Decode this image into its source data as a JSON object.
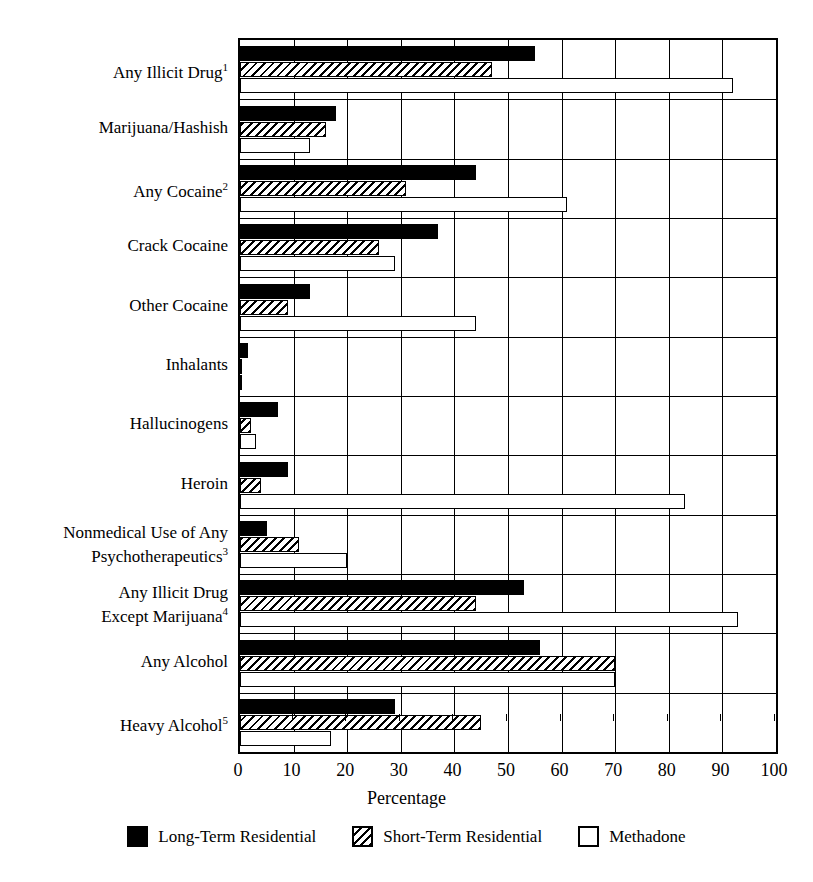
{
  "chart_data": {
    "type": "bar",
    "orientation": "horizontal",
    "title": "",
    "xlabel": "Percentage",
    "ylabel": "",
    "xlim": [
      0,
      100
    ],
    "xticks": [
      "0",
      "10",
      "20",
      "30",
      "40",
      "50",
      "60",
      "70",
      "80",
      "90",
      "100"
    ],
    "grid": true,
    "legend_position": "bottom",
    "categories": [
      "Any Illicit Drug¹",
      "Marijuana/Hashish",
      "Any Cocaine²",
      "Crack Cocaine",
      "Other Cocaine",
      "Inhalants",
      "Hallucinogens",
      "Heroin",
      "Nonmedical Use of Any\nPsychotherapeutics³",
      "Any Illicit Drug\nExcept Marijuana⁴",
      "Any Alcohol",
      "Heavy Alcohol⁵"
    ],
    "series": [
      {
        "name": "Long-Term Residential",
        "fill": "solid-black",
        "color": "#000000",
        "values": [
          55,
          18,
          44,
          37,
          13,
          1.5,
          7,
          9,
          5,
          53,
          56,
          29
        ]
      },
      {
        "name": "Short-Term Residential",
        "fill": "hatched",
        "color": "#000000",
        "values": [
          47,
          16,
          31,
          26,
          9,
          0.3,
          2,
          4,
          11,
          44,
          70,
          45
        ]
      },
      {
        "name": "Methadone",
        "fill": "white",
        "color": "#ffffff",
        "values": [
          92,
          13,
          61,
          29,
          44,
          0.3,
          3,
          83,
          20,
          93,
          70,
          17
        ]
      }
    ]
  },
  "legend": {
    "items": [
      {
        "label": "Long-Term Residential",
        "fill": "solid-black"
      },
      {
        "label": "Short-Term Residential",
        "fill": "hatched"
      },
      {
        "label": "Methadone",
        "fill": "white"
      }
    ]
  },
  "axis": {
    "x_title": "Percentage"
  }
}
